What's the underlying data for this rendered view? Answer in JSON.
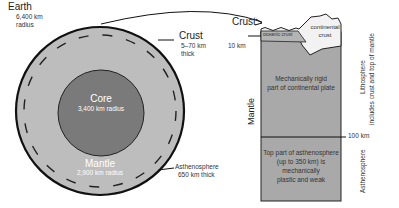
{
  "earth_globe": {
    "earth": {
      "title": "Earth",
      "line1": "6,400 km",
      "line2": "radius"
    },
    "crust": {
      "title": "Crust",
      "line1": "5–70 km",
      "line2": "thick"
    },
    "core": {
      "title": "Core",
      "detail": "3,400 km radius"
    },
    "mantle": {
      "title": "Mantle",
      "detail": "2,900 km radius"
    },
    "asthenosphere": {
      "title": "Asthenosphere",
      "detail": "650 km thick"
    }
  },
  "cross_section": {
    "crust_label": {
      "title": "Crust",
      "detail": "10 km"
    },
    "oceanic_crust": "oceanic crust",
    "continental_crust": {
      "line1": "continental",
      "line2": "crust"
    },
    "mantle_label": "Mantle",
    "lithosphere_upper": {
      "line1": "Mechanically rigid",
      "line2": "part of continental plate"
    },
    "asthenosphere_upper": {
      "line1": "Top part of asthenosphere",
      "line2": "(up to 350 km) is",
      "line3": "mechanically",
      "line4": "plastic and weak"
    },
    "depth_marker": "100 km",
    "lithosphere_side": {
      "line1": "Lithosphere",
      "line2": "includes crust and top of mantle"
    },
    "asthenosphere_side": "Asthenosphere"
  },
  "colors": {
    "mantle_fill": "#bdbdbd",
    "core_fill": "#7a7a7a",
    "section_fill": "#a9a9a9",
    "continental_fill": "#f2f2f2",
    "outline": "#111111"
  }
}
